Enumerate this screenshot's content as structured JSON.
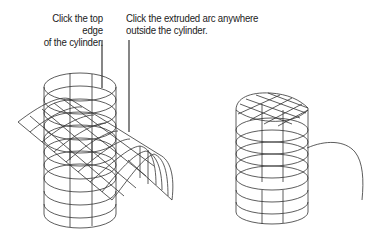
{
  "figure": {
    "callouts": [
      {
        "id": "top-edge",
        "lines": [
          "Click the top edge",
          "of the cylinder."
        ]
      },
      {
        "id": "extruded-arc",
        "lines": [
          "Click the extruded arc anywhere",
          "outside the cylinder."
        ]
      }
    ],
    "left_drawing": {
      "description": "wireframe cylinder intersected by extruded arc surface"
    },
    "right_drawing": {
      "description": "resulting trimmed cylinder with curved top and separate arc"
    }
  }
}
